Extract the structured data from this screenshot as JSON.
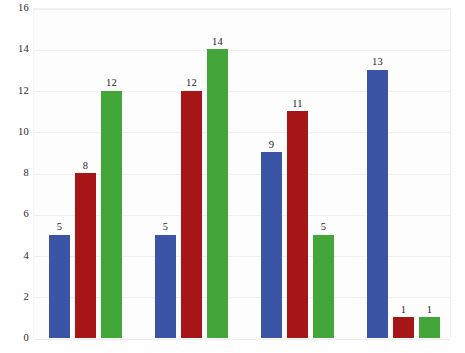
{
  "chart_data": {
    "type": "bar",
    "title": "",
    "subtitle": "",
    "xlabel": "",
    "ylabel": "",
    "ylim": [
      0,
      16
    ],
    "grid": true,
    "legend": "none",
    "categories": [
      "Group 1",
      "Group 2",
      "Group 3",
      "Group 4"
    ],
    "y_ticks": [
      16,
      14,
      12,
      10,
      8,
      6,
      4,
      2,
      0
    ],
    "series": [
      {
        "name": "Blue",
        "color": "#3b54a5",
        "values": [
          5,
          5,
          9,
          13
        ]
      },
      {
        "name": "Red",
        "color": "#a61616",
        "values": [
          8,
          12,
          11,
          1
        ]
      },
      {
        "name": "Green",
        "color": "#43a63b",
        "values": [
          12,
          14,
          5,
          1
        ]
      }
    ],
    "bar_labels": [
      [
        "5",
        "8",
        "12"
      ],
      [
        "5",
        "12",
        "14"
      ],
      [
        "9",
        "11",
        "5"
      ],
      [
        "13",
        "1",
        "1"
      ]
    ],
    "background_color": "#fdfdfd",
    "gridline_color": "#f0f0f0",
    "text_color": "#262626"
  }
}
